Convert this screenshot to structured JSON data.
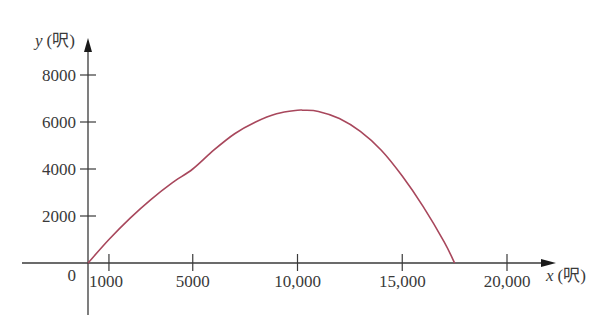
{
  "chart_data": {
    "type": "line",
    "title": "",
    "xlabel": "x (呎)",
    "ylabel": "y (呎)",
    "x_axis": {
      "var": "x",
      "unit": "(呎)",
      "ticks": [
        1000,
        5000,
        10000,
        15000,
        20000
      ],
      "tick_labels": [
        "1000",
        "5000",
        "10,000",
        "15,000",
        "20,000"
      ],
      "origin_label": "0"
    },
    "y_axis": {
      "var": "y",
      "unit": "(呎)",
      "ticks": [
        2000,
        4000,
        6000,
        8000
      ],
      "tick_labels": [
        "2000",
        "4000",
        "6000",
        "8000"
      ]
    },
    "xlim": [
      0,
      22000
    ],
    "ylim": [
      0,
      9000
    ],
    "grid": false,
    "legend": null,
    "series": [
      {
        "name": "trajectory",
        "color": "#a8475c",
        "x": [
          0,
          1000,
          2000,
          3000,
          4000,
          5000,
          6000,
          7000,
          8000,
          9000,
          10000,
          10300,
          11000,
          12000,
          13000,
          14000,
          15000,
          16000,
          17000,
          17500
        ],
        "y": [
          0,
          1000,
          1900,
          2700,
          3400,
          4000,
          4800,
          5500,
          6000,
          6350,
          6500,
          6500,
          6450,
          6150,
          5600,
          4800,
          3700,
          2400,
          900,
          0
        ]
      }
    ]
  }
}
